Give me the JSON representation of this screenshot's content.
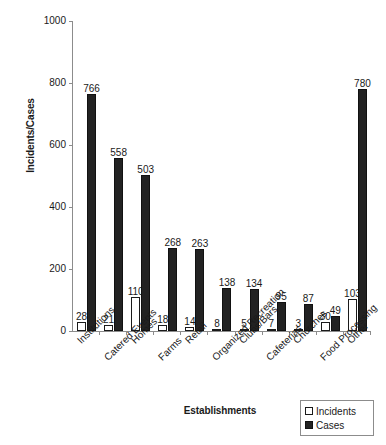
{
  "chart_data": {
    "type": "bar",
    "title": "",
    "xlabel": "Establishments",
    "ylabel": "Incidents/Cases",
    "ylim": [
      0,
      1000
    ],
    "yticks": [
      0,
      200,
      400,
      600,
      800,
      1000
    ],
    "grid": false,
    "legend_position": "bottom-right",
    "categories": [
      "Institutions",
      "Catered Events",
      "Homes",
      "Farms",
      "Retail",
      "Organized Recreation",
      "Clubs/Bars",
      "Cafeterias",
      "Churches",
      "Food Processing",
      "Other"
    ],
    "series": [
      {
        "name": "Incidents",
        "color": "#ffffff",
        "values": [
          28,
          21,
          110,
          18,
          14,
          8,
          5,
          7,
          3,
          30,
          103
        ]
      },
      {
        "name": "Cases",
        "color": "#222222",
        "values": [
          766,
          558,
          503,
          268,
          263,
          138,
          134,
          95,
          87,
          49,
          780
        ]
      }
    ]
  },
  "legend": {
    "items": [
      {
        "label": "Incidents",
        "swatch": "white-square-icon"
      },
      {
        "label": "Cases",
        "swatch": "black-square-icon"
      }
    ]
  }
}
